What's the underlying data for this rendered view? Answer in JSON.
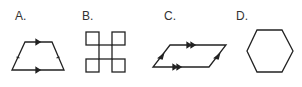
{
  "figure": {
    "options": [
      {
        "label": "A.",
        "shape": "isosceles-trapezoid",
        "marks": "single arrows on parallel top/bottom, single ticks on equal legs"
      },
      {
        "label": "B.",
        "shape": "four-squares-cross",
        "marks": "none"
      },
      {
        "label": "C.",
        "shape": "parallelogram",
        "marks": "double arrows on top/bottom, single arrows on slanted sides"
      },
      {
        "label": "D.",
        "shape": "regular-hexagon",
        "marks": "none"
      }
    ],
    "stroke_color": "#222222",
    "label_color": "#333333"
  }
}
